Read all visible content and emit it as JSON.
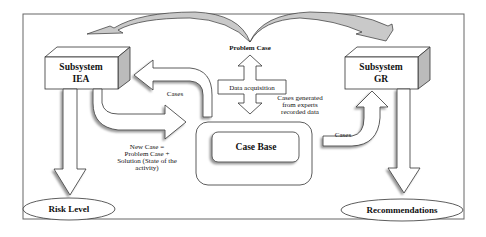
{
  "diagram": {
    "colors": {
      "background": "#ffffff",
      "stroke": "#333333",
      "shadow": "#a8a8a8",
      "curved_arrow_fill": "#c8c8c8",
      "frame": "#555555"
    },
    "nodes": {
      "subsystem_iea": {
        "line1": "Subsystem",
        "line2": "IEA"
      },
      "subsystem_gr": {
        "line1": "Subsystem",
        "line2": "GR"
      },
      "case_base": {
        "label": "Case Base"
      },
      "data_acquisition": {
        "label": "Data acquisition"
      },
      "risk_level": {
        "label": "Risk Level"
      },
      "recommendations": {
        "label": "Recommendations"
      }
    },
    "labels": {
      "problem_case": "Problem Case",
      "cases_left": "Cases",
      "cases_right": "Cases",
      "cases_generated": [
        "Cases generated",
        "from experts",
        "recorded data"
      ],
      "new_case": [
        "New Case =",
        "Problem Case +",
        "Solution (State of the",
        "activity)"
      ]
    },
    "edges": [
      {
        "from": "Problem Case",
        "to": "Subsystem IEA",
        "style": "curved-arrow"
      },
      {
        "from": "Problem Case",
        "to": "Subsystem GR",
        "style": "curved-arrow"
      },
      {
        "from": "Data acquisition",
        "to": "Problem Case",
        "style": "block-arrow"
      },
      {
        "from": "Data acquisition",
        "to": "Case Base",
        "label": "Cases generated from experts recorded data",
        "style": "block-arrow"
      },
      {
        "from": "Case Base",
        "to": "Subsystem IEA",
        "label": "Cases",
        "style": "u-arrow"
      },
      {
        "from": "Subsystem IEA",
        "to": "Case Base",
        "label": "New Case = Problem Case + Solution (State of the activity)",
        "style": "u-arrow"
      },
      {
        "from": "Case Base",
        "to": "Subsystem GR",
        "label": "Cases",
        "style": "u-arrow"
      },
      {
        "from": "Subsystem IEA",
        "to": "Risk Level",
        "style": "block-arrow"
      },
      {
        "from": "Subsystem GR",
        "to": "Recommendations",
        "style": "block-arrow"
      }
    ]
  }
}
